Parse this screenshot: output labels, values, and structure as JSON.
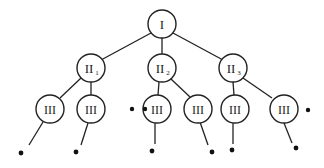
{
  "diagram": {
    "type": "tree",
    "root": {
      "id": "I",
      "label": "I",
      "children": [
        {
          "id": "II1",
          "label": "II",
          "subscript": "1",
          "children": [
            {
              "id": "III-a",
              "label": "III",
              "leaf": true
            },
            {
              "id": "III-b",
              "label": "III",
              "leaf": true
            }
          ]
        },
        {
          "id": "II2",
          "label": "II",
          "subscript": "2",
          "children": [
            {
              "id": "III-c",
              "label": "III",
              "leaf": true
            },
            {
              "id": "III-d",
              "label": "III",
              "leaf": true
            }
          ]
        },
        {
          "id": "II3",
          "label": "II",
          "subscript": "3",
          "children": [
            {
              "id": "III-e",
              "label": "III",
              "leaf": true
            },
            {
              "id": "III-f",
              "label": "III",
              "leaf": true
            }
          ]
        }
      ]
    },
    "ellipsis_after": [
      "III-b",
      "III-f"
    ]
  },
  "labels": {
    "root": "I",
    "level2": "II",
    "level3": "III",
    "sub1": "1",
    "sub2": "2",
    "sub3": "3"
  }
}
